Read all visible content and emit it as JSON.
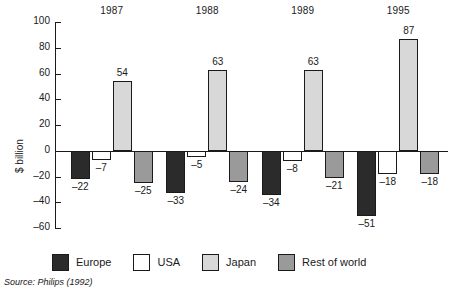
{
  "chart_data": {
    "type": "bar",
    "title": "",
    "subtitle": "",
    "xlabel": "",
    "ylabel": "$ billion",
    "ylim": [
      -60,
      100
    ],
    "yticks": [
      100,
      80,
      60,
      40,
      20,
      0,
      -20,
      -40,
      -60
    ],
    "ytick_labels": [
      "100",
      "80",
      "60",
      "40",
      "20",
      "0",
      "-20",
      "-40",
      "-60"
    ],
    "grid": false,
    "legend_position": "bottom",
    "categories": [
      "1987",
      "1988",
      "1989",
      "1995"
    ],
    "series": [
      {
        "name": "Europe",
        "color": "#2b2b2b",
        "values": [
          -22,
          -33,
          -34,
          -51
        ],
        "labels": [
          "–22",
          "–33",
          "–34",
          "–51"
        ]
      },
      {
        "name": "USA",
        "color": "#ffffff",
        "values": [
          -7,
          -5,
          -8,
          -18
        ],
        "labels": [
          "–7",
          "–5",
          "–8",
          "–18"
        ]
      },
      {
        "name": "Japan",
        "color": "#d8d8d8",
        "values": [
          54,
          63,
          63,
          87
        ],
        "labels": [
          "54",
          "63",
          "63",
          "87"
        ]
      },
      {
        "name": "Rest of world",
        "color": "#9a9a9a",
        "values": [
          -25,
          -24,
          -21,
          -18
        ],
        "labels": [
          "–25",
          "–24",
          "–21",
          "–18"
        ]
      }
    ],
    "source": "Source: Philips (1992)"
  },
  "legend": {
    "items": [
      {
        "label": "Europe"
      },
      {
        "label": "USA"
      },
      {
        "label": "Japan"
      },
      {
        "label": "Rest of world"
      }
    ]
  },
  "axis": {
    "y_title": "$ billion"
  },
  "footer": {
    "source": "Source: Philips (1992)"
  }
}
